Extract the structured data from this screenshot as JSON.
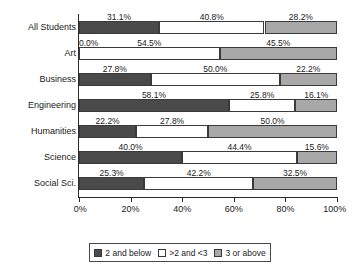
{
  "chart_data": {
    "type": "bar",
    "orientation": "horizontal",
    "stacked": true,
    "stack_mode": "percent",
    "title": "",
    "subtitle": "",
    "xlabel": "",
    "ylabel": "",
    "xlim": [
      0,
      100
    ],
    "xticks": [
      "0%",
      "20%",
      "40%",
      "60%",
      "80%",
      "100%"
    ],
    "xtick_values": [
      0,
      20,
      40,
      60,
      80,
      100
    ],
    "grid": false,
    "legend_position": "bottom",
    "categories": [
      "All Students",
      "Art",
      "Business",
      "Engineering",
      "Humanities",
      "Science",
      "Social Sci."
    ],
    "series": [
      {
        "name": "2 and below",
        "color": "#4a4a4a",
        "values": [
          31.1,
          0.0,
          27.8,
          58.1,
          22.2,
          40.0,
          25.3
        ],
        "labels": [
          "31.1%",
          "0.0%",
          "27.8%",
          "58.1%",
          "22.2%",
          "40.0%",
          "25.3%"
        ]
      },
      {
        "name": ">2 and <3",
        "color": "#ffffff",
        "values": [
          40.8,
          54.5,
          50.0,
          25.8,
          27.8,
          44.4,
          42.2
        ],
        "labels": [
          "40.8%",
          "54.5%",
          "50.0%",
          "25.8%",
          "27.8%",
          "44.4%",
          "42.2%"
        ]
      },
      {
        "name": "3 or above",
        "color": "#a8a8a8",
        "values": [
          28.2,
          45.5,
          22.2,
          16.1,
          50.0,
          15.6,
          32.5
        ],
        "labels": [
          "28.2%",
          "45.5%",
          "22.2%",
          "16.1%",
          "50.0%",
          "15.6%",
          "32.5%"
        ]
      }
    ]
  },
  "legend": {
    "items": [
      {
        "label": "2 and below",
        "swatch": "s0"
      },
      {
        "label": ">2 and <3",
        "swatch": "s1"
      },
      {
        "label": "3 or above",
        "swatch": "s2"
      }
    ]
  }
}
